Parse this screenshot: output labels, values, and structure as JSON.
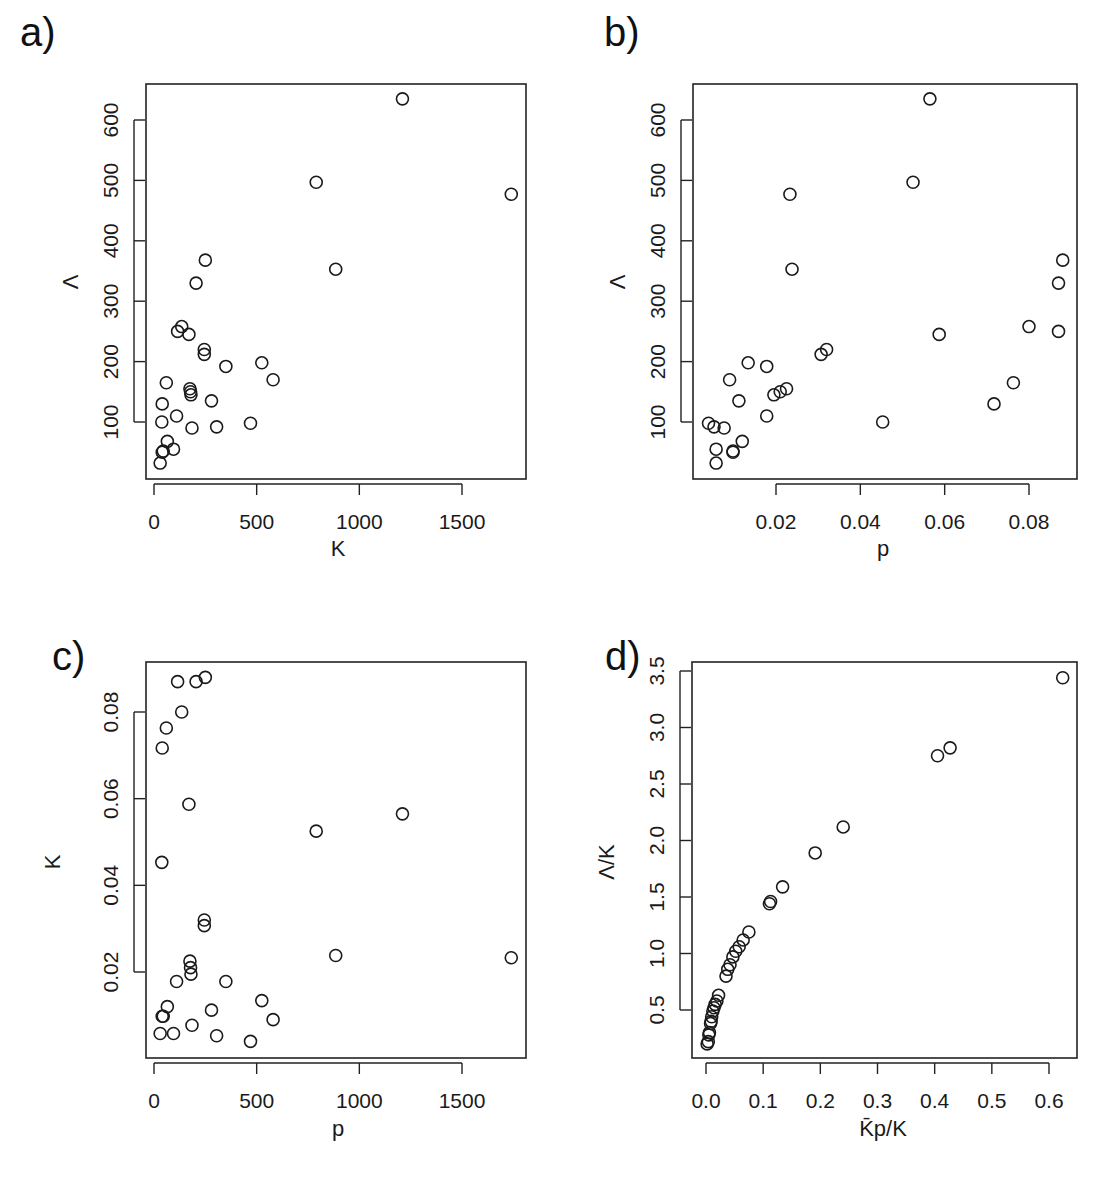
{
  "figure": {
    "panels": [
      {
        "id": "a",
        "label": "a)"
      },
      {
        "id": "b",
        "label": "b)"
      },
      {
        "id": "c",
        "label": "c)"
      },
      {
        "id": "d",
        "label": "d)"
      }
    ]
  },
  "chart_data": [
    {
      "panel": "a)",
      "type": "scatter",
      "title": "",
      "xlabel": "K",
      "ylabel": "Λ",
      "xlim": [
        0,
        1800
      ],
      "ylim": [
        20,
        660
      ],
      "xticks": [
        0,
        500,
        1000,
        1500
      ],
      "xtick_labels": [
        "0",
        "500",
        "1000",
        "1500"
      ],
      "yticks": [
        100,
        200,
        300,
        400,
        500,
        600
      ],
      "ytick_labels": [
        "100",
        "200",
        "300",
        "400",
        "500",
        "600"
      ],
      "grid": false,
      "marker": "open-circle",
      "x": [
        1210,
        790,
        1740,
        885,
        250,
        205,
        135,
        115,
        170,
        245,
        245,
        350,
        525,
        580,
        60,
        175,
        178,
        180,
        280,
        40,
        110,
        470,
        185,
        305,
        38,
        65,
        45,
        40,
        95,
        30
      ],
      "y": [
        635,
        497,
        477,
        353,
        368,
        330,
        258,
        250,
        245,
        220,
        212,
        192,
        198,
        170,
        165,
        155,
        150,
        145,
        135,
        130,
        110,
        98,
        90,
        92,
        100,
        68,
        52,
        50,
        55,
        32
      ]
    },
    {
      "panel": "b)",
      "type": "scatter",
      "title": "",
      "xlabel": "p",
      "ylabel": "Λ",
      "xlim": [
        0.0025,
        0.0895
      ],
      "ylim": [
        20,
        660
      ],
      "xticks": [
        0.02,
        0.04,
        0.06,
        0.08
      ],
      "xtick_labels": [
        "0.02",
        "0.04",
        "0.06",
        "0.08"
      ],
      "yticks": [
        100,
        200,
        300,
        400,
        500,
        600
      ],
      "ytick_labels": [
        "100",
        "200",
        "300",
        "400",
        "500",
        "600"
      ],
      "grid": false,
      "marker": "open-circle",
      "x": [
        0.0565,
        0.0525,
        0.0233,
        0.0238,
        0.088,
        0.087,
        0.08,
        0.087,
        0.0587,
        0.032,
        0.0307,
        0.0178,
        0.0134,
        0.009,
        0.0763,
        0.0225,
        0.021,
        0.0195,
        0.0112,
        0.0717,
        0.0178,
        0.0453,
        0.0077,
        0.0053,
        0.004,
        0.012,
        0.0098,
        0.0098,
        0.0058,
        0.0058
      ],
      "y": [
        635,
        497,
        477,
        353,
        368,
        330,
        258,
        250,
        245,
        220,
        212,
        192,
        198,
        170,
        165,
        155,
        150,
        145,
        135,
        130,
        110,
        100,
        90,
        92,
        98,
        68,
        52,
        50,
        55,
        32
      ]
    },
    {
      "panel": "c)",
      "type": "scatter",
      "title": "",
      "xlabel": "p",
      "ylabel": "K",
      "xlim": [
        0,
        1800
      ],
      "ylim": [
        0.0025,
        0.0905
      ],
      "xticks": [
        0,
        500,
        1000,
        1500
      ],
      "xtick_labels": [
        "0",
        "500",
        "1000",
        "1500"
      ],
      "yticks": [
        0.02,
        0.04,
        0.06,
        0.08
      ],
      "ytick_labels": [
        "0.02",
        "0.04",
        "0.06",
        "0.08"
      ],
      "grid": false,
      "marker": "open-circle",
      "x": [
        1210,
        790,
        1740,
        885,
        250,
        205,
        135,
        115,
        170,
        245,
        245,
        350,
        525,
        580,
        60,
        175,
        178,
        180,
        280,
        40,
        110,
        470,
        185,
        305,
        38,
        65,
        45,
        40,
        95,
        30
      ],
      "y": [
        0.0565,
        0.0525,
        0.0233,
        0.0238,
        0.088,
        0.087,
        0.08,
        0.087,
        0.0587,
        0.032,
        0.0307,
        0.0178,
        0.0134,
        0.009,
        0.0763,
        0.0225,
        0.021,
        0.0195,
        0.0112,
        0.0717,
        0.0178,
        0.004,
        0.0077,
        0.0053,
        0.0453,
        0.012,
        0.0098,
        0.0098,
        0.0058,
        0.0058
      ]
    },
    {
      "panel": "d)",
      "type": "scatter",
      "title": "",
      "xlabel": "K̄p/K",
      "ylabel": "Λ/K",
      "xlim": [
        -0.025,
        0.65
      ],
      "ylim": [
        0.09,
        3.57
      ],
      "xticks": [
        0.0,
        0.1,
        0.2,
        0.3,
        0.4,
        0.5,
        0.6
      ],
      "xtick_labels": [
        "0.0",
        "0.1",
        "0.2",
        "0.3",
        "0.4",
        "0.5",
        "0.6"
      ],
      "yticks": [
        0.5,
        1.0,
        1.5,
        2.0,
        2.5,
        3.0,
        3.5
      ],
      "ytick_labels": [
        "0.5",
        "1.0",
        "1.5",
        "2.0",
        "2.5",
        "3.0",
        "3.5"
      ],
      "grid": false,
      "marker": "open-circle",
      "x": [
        0.624,
        0.427,
        0.405,
        0.24,
        0.191,
        0.134,
        0.113,
        0.111,
        0.075,
        0.065,
        0.058,
        0.052,
        0.047,
        0.042,
        0.038,
        0.035,
        0.022,
        0.019,
        0.016,
        0.014,
        0.012,
        0.01,
        0.009,
        0.008,
        0.006,
        0.005,
        0.004,
        0.002
      ],
      "y": [
        3.44,
        2.82,
        2.75,
        2.12,
        1.89,
        1.59,
        1.46,
        1.44,
        1.19,
        1.12,
        1.06,
        1.02,
        0.97,
        0.9,
        0.86,
        0.8,
        0.63,
        0.58,
        0.55,
        0.52,
        0.49,
        0.44,
        0.4,
        0.38,
        0.3,
        0.28,
        0.22,
        0.2
      ]
    }
  ]
}
